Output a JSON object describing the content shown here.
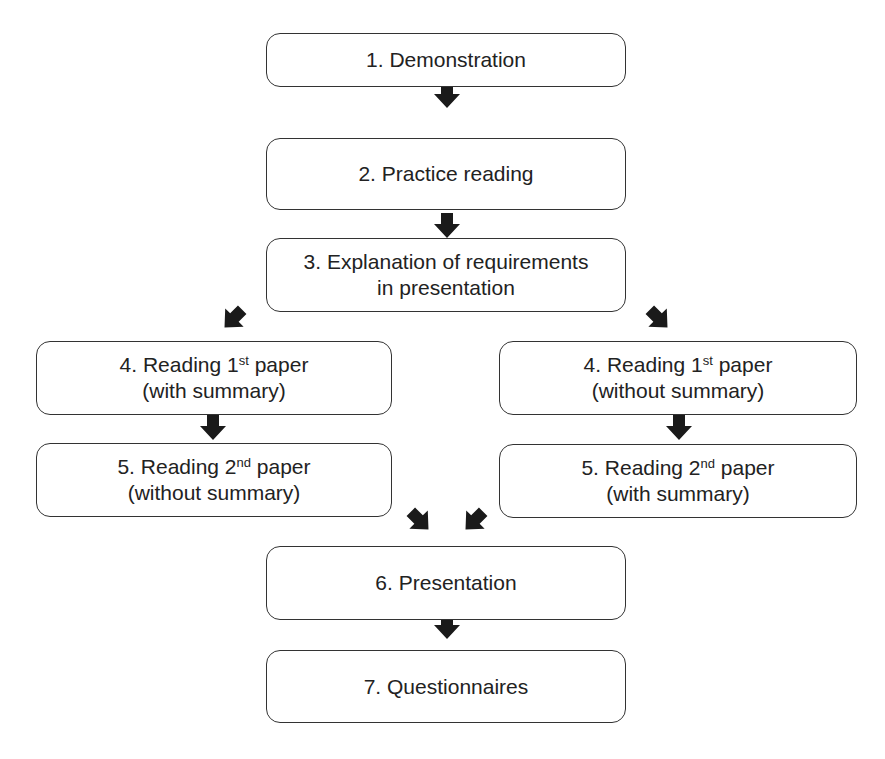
{
  "diagram": {
    "type": "flowchart",
    "nodes": [
      {
        "id": "n1",
        "lines": [
          "1. Demonstration"
        ]
      },
      {
        "id": "n2",
        "lines": [
          "2. Practice reading"
        ]
      },
      {
        "id": "n3",
        "lines": [
          "3. Explanation of requirements",
          "in presentation"
        ]
      },
      {
        "id": "n4a",
        "line1_pre": "4. Reading 1",
        "line1_sup": "st",
        "line1_post": " paper",
        "line2": "(with summary)"
      },
      {
        "id": "n5a",
        "line1_pre": "5. Reading 2",
        "line1_sup": "nd",
        "line1_post": " paper",
        "line2": "(without summary)"
      },
      {
        "id": "n4b",
        "line1_pre": "4. Reading 1",
        "line1_sup": "st",
        "line1_post": " paper",
        "line2": "(without summary)"
      },
      {
        "id": "n5b",
        "line1_pre": "5. Reading 2",
        "line1_sup": "nd",
        "line1_post": " paper",
        "line2": "(with summary)"
      },
      {
        "id": "n6",
        "lines": [
          "6. Presentation"
        ]
      },
      {
        "id": "n7",
        "lines": [
          "7. Questionnaires"
        ]
      }
    ],
    "edges": [
      [
        "n1",
        "n2"
      ],
      [
        "n2",
        "n3"
      ],
      [
        "n3",
        "n4a"
      ],
      [
        "n3",
        "n4b"
      ],
      [
        "n4a",
        "n5a"
      ],
      [
        "n4b",
        "n5b"
      ],
      [
        "n5a",
        "n6"
      ],
      [
        "n5b",
        "n6"
      ],
      [
        "n6",
        "n7"
      ]
    ],
    "colors": {
      "border": "#333333",
      "arrow": "#1a1a1a",
      "text": "#222222",
      "background": "#ffffff"
    }
  }
}
